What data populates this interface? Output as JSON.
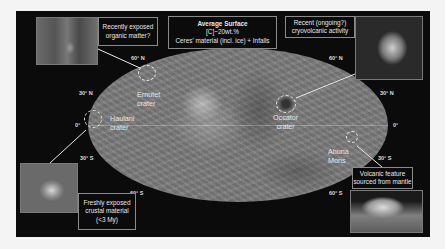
{
  "figure": {
    "center_box": {
      "title": "Average Surface",
      "line1": "[C]~20wt.%",
      "line2": "Ceres' material (incl. ice) + Infalls"
    },
    "callouts": [
      {
        "id": "organic",
        "lines": [
          "Recently exposed",
          "organic matter?"
        ]
      },
      {
        "id": "cryovolcanic",
        "lines": [
          "Recent (ongoing?)",
          "cryovolcanic activity"
        ]
      },
      {
        "id": "crustal",
        "lines": [
          "Freshly exposed",
          "crustal material",
          "(<3 My)"
        ]
      },
      {
        "id": "volcanic",
        "lines": [
          "Volcanic feature",
          "sourced from mantle"
        ]
      }
    ],
    "sites": [
      {
        "name_line1": "Ernutet",
        "name_line2": "crater"
      },
      {
        "name_line1": "Haulani",
        "name_line2": "crater"
      },
      {
        "name_line1": "Occator",
        "name_line2": "crater"
      },
      {
        "name_line1": "Ahuna",
        "name_line2": "Mons"
      }
    ],
    "latitude_labels": {
      "left": [
        "60° N",
        "30° N",
        "0°",
        "30° S",
        "60° S"
      ],
      "right": [
        "60° N",
        "30° N",
        "0°",
        "30° S",
        "60° S"
      ]
    },
    "colors": {
      "background": "#0b0b0b",
      "map_gray": "#7c7c7c",
      "text": "#e6e6e6",
      "leader_line": "#e8e8e8"
    }
  }
}
